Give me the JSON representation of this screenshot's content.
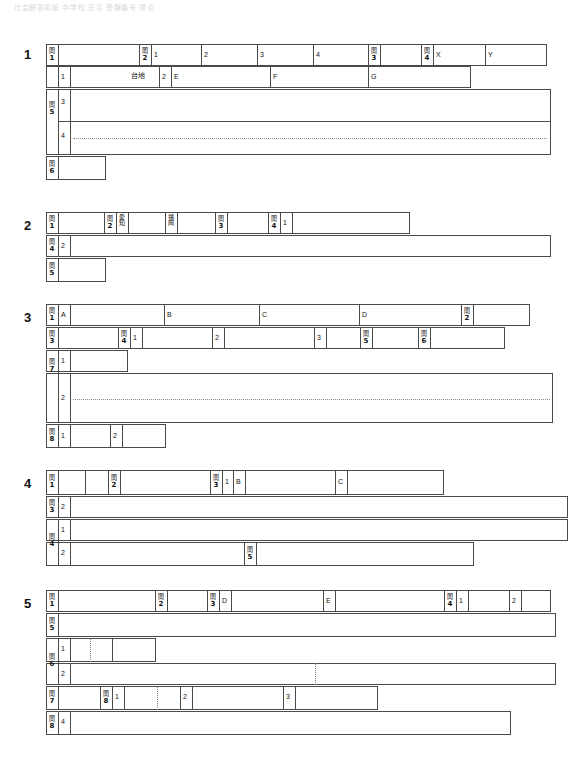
{
  "document": {
    "title": "解答用紙",
    "header_note": "社会解答用紙  中学校  氏名  受験番号  得点"
  },
  "kanji": {
    "mon": "問"
  },
  "blocks": [
    {
      "id": "block-1",
      "number": "1",
      "rows": [
        {
          "id": "b1-r1",
          "labels": [
            "問1",
            "問2",
            "1",
            "2",
            "3",
            "4",
            "問3",
            "問4",
            "X",
            "Y"
          ]
        },
        {
          "id": "b1-r2",
          "labels": [
            "1",
            "台地",
            "2",
            "E",
            "F",
            "G"
          ]
        },
        {
          "id": "b1-r3",
          "labels": [
            "問5",
            "3"
          ]
        },
        {
          "id": "b1-r4",
          "labels": [
            "4"
          ]
        },
        {
          "id": "b1-r5",
          "labels": [
            "問6"
          ]
        }
      ]
    },
    {
      "id": "block-2",
      "number": "2",
      "rows": [
        {
          "id": "b2-r1",
          "labels": [
            "問1",
            "問2",
            "愛知",
            "福岡",
            "問3",
            "問4",
            "1"
          ]
        },
        {
          "id": "b2-r2",
          "labels": [
            "問4",
            "2"
          ]
        },
        {
          "id": "b2-r3",
          "labels": [
            "問5"
          ]
        }
      ]
    },
    {
      "id": "block-3",
      "number": "3",
      "rows": [
        {
          "id": "b3-r1",
          "labels": [
            "問1",
            "A",
            "B",
            "C",
            "D",
            "問2"
          ]
        },
        {
          "id": "b3-r2",
          "labels": [
            "問3",
            "問4",
            "1",
            "2",
            "3",
            "問5",
            "問6"
          ]
        },
        {
          "id": "b3-r3",
          "labels": [
            "1"
          ]
        },
        {
          "id": "b3-r4",
          "labels": [
            "問7",
            "2"
          ]
        },
        {
          "id": "b3-r5",
          "labels": [
            "問8",
            "1",
            "2"
          ]
        }
      ]
    },
    {
      "id": "block-4",
      "number": "4",
      "rows": [
        {
          "id": "b4-r1",
          "labels": [
            "問1",
            "問2",
            "問3",
            "1",
            "B",
            "C"
          ]
        },
        {
          "id": "b4-r2",
          "labels": [
            "問3",
            "2"
          ]
        },
        {
          "id": "b4-r3",
          "labels": [
            "1"
          ]
        },
        {
          "id": "b4-r4",
          "labels": [
            "問4",
            "2",
            "問5"
          ]
        }
      ]
    },
    {
      "id": "block-5",
      "number": "5",
      "rows": [
        {
          "id": "b5-r1",
          "labels": [
            "問1",
            "問2",
            "問3",
            "D",
            "E",
            "問4",
            "1",
            "2"
          ]
        },
        {
          "id": "b5-r2",
          "labels": [
            "問5"
          ]
        },
        {
          "id": "b5-r3",
          "labels": [
            "1"
          ]
        },
        {
          "id": "b5-r4",
          "labels": [
            "問6",
            "2"
          ]
        },
        {
          "id": "b5-r5",
          "labels": [
            "問7",
            "問8",
            "1",
            "2",
            "3"
          ]
        },
        {
          "id": "b5-r6",
          "labels": [
            "問8",
            "4"
          ]
        }
      ]
    }
  ],
  "labels": {
    "mon1": "問",
    "mon2": "問",
    "mon3": "問",
    "mon4": "問",
    "mon5": "問",
    "mon6": "問",
    "mon7": "問",
    "mon8": "問",
    "n1": "1",
    "n2": "2",
    "n3": "3",
    "n4": "4",
    "n5": "5",
    "n6": "6",
    "n7": "7",
    "n8": "8",
    "A": "A",
    "B": "B",
    "C": "C",
    "D": "D",
    "E": "E",
    "F": "F",
    "G": "G",
    "X": "X",
    "Y": "Y",
    "daichi": "台地",
    "aichi": "愛知",
    "fukuoka": "福岡",
    "blk1": "1",
    "blk2": "2",
    "blk3": "3",
    "blk4": "4",
    "blk5": "5"
  },
  "colors": {
    "line": "#4a4a4a",
    "dotted": "#8a8a8a",
    "text": "#111111",
    "background": "#ffffff"
  }
}
